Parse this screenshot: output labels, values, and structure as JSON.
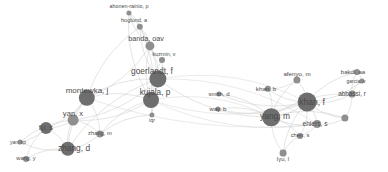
{
  "figure": {
    "type": "network-graph",
    "subtype": "co-authorship-bibliometric-map",
    "background_color": "#ffffff",
    "width": 388,
    "height": 172,
    "node_color": "#8f8f8f",
    "node_color_dark": "#6e6e6e",
    "edge_color": "#c9c9c9",
    "label_color": "#4a4a4a"
  },
  "chart_data": {
    "type": "scatter",
    "title": "",
    "xlabel": "",
    "ylabel": "",
    "nodes": [
      {
        "id": "ahonen-rainio-p",
        "label": "ahonen-rainio, p",
        "x": 129,
        "y": 13,
        "r": 2.6,
        "font": 5.4,
        "label_dx": 0,
        "label_dy": -6
      },
      {
        "id": "hoglund-a",
        "label": "hoglund, a",
        "x": 140,
        "y": 27,
        "r": 3.2,
        "font": 5.6,
        "label_dx": -6,
        "label_dy": -6
      },
      {
        "id": "banda-oav",
        "label": "banda, oav",
        "x": 150,
        "y": 46,
        "r": 4.6,
        "font": 7.2,
        "label_dx": -4,
        "label_dy": -7
      },
      {
        "id": "kuzmin-v",
        "label": "kuzmin, v",
        "x": 162,
        "y": 60,
        "r": 3.0,
        "font": 5.4,
        "label_dx": 2,
        "label_dy": -5
      },
      {
        "id": "goerlandt-f",
        "label": "goerlandt, f",
        "x": 158,
        "y": 79,
        "r": 8.6,
        "font": 8.4,
        "label_dx": -6,
        "label_dy": -8
      },
      {
        "id": "montewka-j",
        "label": "montewka, j",
        "x": 87,
        "y": 98,
        "r": 8.2,
        "font": 8.0,
        "label_dx": 0,
        "label_dy": -7
      },
      {
        "id": "kujala-p",
        "label": "kujala, p",
        "x": 151,
        "y": 100,
        "r": 8.0,
        "font": 8.2,
        "label_dx": 4,
        "label_dy": -7
      },
      {
        "id": "iqr",
        "label": "iqr",
        "x": 152,
        "y": 115,
        "r": 2.6,
        "font": 5.2,
        "label_dx": 0,
        "label_dy": 6
      },
      {
        "id": "yan-x",
        "label": "yan, x",
        "x": 73,
        "y": 120,
        "r": 5.4,
        "font": 7.6,
        "label_dx": 0,
        "label_dy": -6
      },
      {
        "id": "fu-s",
        "label": "fu, s",
        "x": 46,
        "y": 128,
        "r": 6.0,
        "font": 7.6,
        "label_dx": 0,
        "label_dy": 0
      },
      {
        "id": "zhang-m",
        "label": "zhang, m",
        "x": 100,
        "y": 134,
        "r": 3.6,
        "font": 5.8,
        "label_dx": 0,
        "label_dy": 0
      },
      {
        "id": "zhang-d",
        "label": "zhang, d",
        "x": 68,
        "y": 149,
        "r": 7.2,
        "font": 8.4,
        "label_dx": 6,
        "label_dy": -1
      },
      {
        "id": "yan-xp",
        "label": "yan, xp",
        "x": 20,
        "y": 142,
        "r": 2.4,
        "font": 5.0,
        "label_dx": -2,
        "label_dy": 0
      },
      {
        "id": "wang-y",
        "label": "wang, y",
        "x": 26,
        "y": 159,
        "r": 3.0,
        "font": 5.6,
        "label_dx": 0,
        "label_dy": 0
      },
      {
        "id": "smith-d",
        "label": "smith, d",
        "x": 219,
        "y": 94,
        "r": 2.6,
        "font": 6.0,
        "label_dx": 0,
        "label_dy": 0
      },
      {
        "id": "way-b",
        "label": "way, b",
        "x": 218,
        "y": 109,
        "r": 2.6,
        "font": 6.0,
        "label_dx": 0,
        "label_dy": 0
      },
      {
        "id": "khan-b",
        "label": "khan, b",
        "x": 268,
        "y": 89,
        "r": 3.2,
        "font": 6.2,
        "label_dx": -2,
        "label_dy": 0
      },
      {
        "id": "afenyo-m",
        "label": "afenyo, m",
        "x": 297,
        "y": 80,
        "r": 3.6,
        "font": 6.2,
        "label_dx": 0,
        "label_dy": -6
      },
      {
        "id": "khan-f",
        "label": "khan, f",
        "x": 307,
        "y": 102,
        "r": 9.4,
        "font": 8.6,
        "label_dx": 5,
        "label_dy": 0
      },
      {
        "id": "yang-m",
        "label": "yang, m",
        "x": 271,
        "y": 117,
        "r": 8.8,
        "font": 8.4,
        "label_dx": 4,
        "label_dy": -1
      },
      {
        "id": "bakdi-aa",
        "label": "bakdi, aa",
        "x": 357,
        "y": 72,
        "r": 3.0,
        "font": 6.0,
        "label_dx": -4,
        "label_dy": 0
      },
      {
        "id": "garcia-v",
        "label": "garcia, v",
        "x": 362,
        "y": 81,
        "r": 2.6,
        "font": 5.0,
        "label_dx": -6,
        "label_dy": 0
      },
      {
        "id": "abbassi-r",
        "label": "abbassi, r",
        "x": 352,
        "y": 94,
        "r": 3.4,
        "font": 6.4,
        "label_dx": 0,
        "label_dy": 0
      },
      {
        "id": "ehlers-s",
        "label": "ehlers, s",
        "x": 317,
        "y": 124,
        "r": 4.0,
        "font": 6.6,
        "label_dx": -2,
        "label_dy": 0
      },
      {
        "id": "ehlers-node",
        "label": "",
        "x": 345,
        "y": 118,
        "r": 3.6,
        "font": 0,
        "label_dx": 0,
        "label_dy": 0
      },
      {
        "id": "chen-s",
        "label": "chen, s",
        "x": 300,
        "y": 136,
        "r": 3.0,
        "font": 5.8,
        "label_dx": 0,
        "label_dy": 0
      },
      {
        "id": "lyu-l",
        "label": "lyu, l",
        "x": 283,
        "y": 153,
        "r": 3.4,
        "font": 6.0,
        "label_dx": 0,
        "label_dy": 6
      }
    ],
    "edges": [
      [
        "ahonen-rainio-p",
        "hoglund-a"
      ],
      [
        "ahonen-rainio-p",
        "banda-oav"
      ],
      [
        "ahonen-rainio-p",
        "goerlandt-f"
      ],
      [
        "ahonen-rainio-p",
        "kujala-p"
      ],
      [
        "hoglund-a",
        "banda-oav"
      ],
      [
        "hoglund-a",
        "goerlandt-f"
      ],
      [
        "hoglund-a",
        "kujala-p"
      ],
      [
        "hoglund-a",
        "montewka-j"
      ],
      [
        "banda-oav",
        "goerlandt-f"
      ],
      [
        "banda-oav",
        "kujala-p"
      ],
      [
        "banda-oav",
        "montewka-j"
      ],
      [
        "banda-oav",
        "kuzmin-v"
      ],
      [
        "kuzmin-v",
        "goerlandt-f"
      ],
      [
        "kuzmin-v",
        "kujala-p"
      ],
      [
        "goerlandt-f",
        "kujala-p"
      ],
      [
        "goerlandt-f",
        "montewka-j"
      ],
      [
        "goerlandt-f",
        "yan-x"
      ],
      [
        "goerlandt-f",
        "zhang-d"
      ],
      [
        "goerlandt-f",
        "khan-f"
      ],
      [
        "goerlandt-f",
        "yang-m"
      ],
      [
        "goerlandt-f",
        "ehlers-s"
      ],
      [
        "goerlandt-f",
        "iqr"
      ],
      [
        "montewka-j",
        "kujala-p"
      ],
      [
        "montewka-j",
        "yan-x"
      ],
      [
        "montewka-j",
        "fu-s"
      ],
      [
        "montewka-j",
        "zhang-d"
      ],
      [
        "montewka-j",
        "zhang-m"
      ],
      [
        "montewka-j",
        "ehlers-s"
      ],
      [
        "kujala-p",
        "iqr"
      ],
      [
        "kujala-p",
        "zhang-m"
      ],
      [
        "kujala-p",
        "yan-x"
      ],
      [
        "kujala-p",
        "khan-f"
      ],
      [
        "kujala-p",
        "yang-m"
      ],
      [
        "kujala-p",
        "ehlers-s"
      ],
      [
        "yan-x",
        "fu-s"
      ],
      [
        "yan-x",
        "zhang-d"
      ],
      [
        "yan-x",
        "zhang-m"
      ],
      [
        "yan-x",
        "yan-xp"
      ],
      [
        "fu-s",
        "zhang-d"
      ],
      [
        "fu-s",
        "wang-y"
      ],
      [
        "fu-s",
        "yan-xp"
      ],
      [
        "zhang-d",
        "wang-y"
      ],
      [
        "zhang-d",
        "yan-xp"
      ],
      [
        "zhang-d",
        "zhang-m"
      ],
      [
        "zhang-m",
        "iqr"
      ],
      [
        "smith-d",
        "khan-f"
      ],
      [
        "smith-d",
        "yang-m"
      ],
      [
        "way-b",
        "khan-f"
      ],
      [
        "way-b",
        "yang-m"
      ],
      [
        "khan-b",
        "khan-f"
      ],
      [
        "khan-b",
        "yang-m"
      ],
      [
        "khan-b",
        "afenyo-m"
      ],
      [
        "afenyo-m",
        "khan-f"
      ],
      [
        "afenyo-m",
        "yang-m"
      ],
      [
        "khan-f",
        "yang-m"
      ],
      [
        "khan-f",
        "abbassi-r"
      ],
      [
        "khan-f",
        "bakdi-aa"
      ],
      [
        "khan-f",
        "garcia-v"
      ],
      [
        "khan-f",
        "ehlers-s"
      ],
      [
        "khan-f",
        "ehlers-node"
      ],
      [
        "khan-f",
        "chen-s"
      ],
      [
        "khan-f",
        "lyu-l"
      ],
      [
        "yang-m",
        "abbassi-r"
      ],
      [
        "yang-m",
        "ehlers-s"
      ],
      [
        "yang-m",
        "chen-s"
      ],
      [
        "yang-m",
        "lyu-l"
      ],
      [
        "yang-m",
        "ehlers-node"
      ],
      [
        "bakdi-aa",
        "abbassi-r"
      ],
      [
        "bakdi-aa",
        "garcia-v"
      ],
      [
        "garcia-v",
        "abbassi-r"
      ],
      [
        "abbassi-r",
        "ehlers-node"
      ],
      [
        "ehlers-s",
        "ehlers-node"
      ],
      [
        "ehlers-s",
        "chen-s"
      ],
      [
        "chen-s",
        "lyu-l"
      ]
    ]
  }
}
